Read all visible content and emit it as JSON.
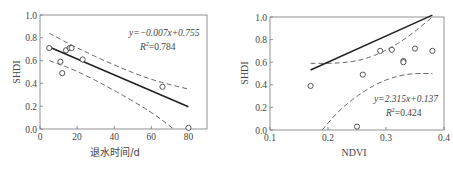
{
  "chart_data": [
    {
      "type": "scatter",
      "title": "",
      "xlabel": "退水时间/d",
      "ylabel": "SHDI",
      "xlim": [
        0,
        90
      ],
      "ylim": [
        0.0,
        1.0
      ],
      "xticks": [
        "0",
        "20",
        "40",
        "60",
        "80"
      ],
      "yticks": [
        "0.0",
        "0.2",
        "0.4",
        "0.6",
        "0.8",
        "1.0"
      ],
      "grid": false,
      "points": [
        {
          "x": 5,
          "y": 0.71
        },
        {
          "x": 11,
          "y": 0.59
        },
        {
          "x": 12,
          "y": 0.49
        },
        {
          "x": 14,
          "y": 0.69
        },
        {
          "x": 16,
          "y": 0.71
        },
        {
          "x": 17,
          "y": 0.71
        },
        {
          "x": 23,
          "y": 0.61
        },
        {
          "x": 66,
          "y": 0.37
        },
        {
          "x": 80,
          "y": 0.01
        }
      ],
      "fit": {
        "slope": -0.007,
        "intercept": 0.755,
        "x_range": [
          5,
          80
        ]
      },
      "confidence_band": {
        "upper": [
          [
            5,
            0.84
          ],
          [
            20,
            0.71
          ],
          [
            40,
            0.56
          ],
          [
            60,
            0.43
          ],
          [
            80,
            0.35
          ]
        ],
        "lower": [
          [
            5,
            0.6
          ],
          [
            20,
            0.51
          ],
          [
            40,
            0.34
          ],
          [
            60,
            0.15
          ],
          [
            72,
            0.0
          ]
        ]
      },
      "annotation": {
        "equation": "y=−0.007x+0.755",
        "r2": "R²=0.784"
      }
    },
    {
      "type": "scatter",
      "title": "",
      "xlabel": "NDVI",
      "ylabel": "SHDI",
      "xlim": [
        0.1,
        0.4
      ],
      "ylim": [
        0.0,
        1.0
      ],
      "xticks": [
        "0.1",
        "0.2",
        "0.3",
        "0.4"
      ],
      "yticks": [
        "0.0",
        "0.2",
        "0.4",
        "0.6",
        "0.8",
        "1.0"
      ],
      "grid": false,
      "points": [
        {
          "x": 0.17,
          "y": 0.39
        },
        {
          "x": 0.25,
          "y": 0.03
        },
        {
          "x": 0.26,
          "y": 0.49
        },
        {
          "x": 0.29,
          "y": 0.7
        },
        {
          "x": 0.31,
          "y": 0.71
        },
        {
          "x": 0.33,
          "y": 0.61
        },
        {
          "x": 0.33,
          "y": 0.6
        },
        {
          "x": 0.35,
          "y": 0.72
        },
        {
          "x": 0.38,
          "y": 0.7
        }
      ],
      "fit": {
        "slope": 2.315,
        "intercept": 0.137,
        "x_range": [
          0.17,
          0.38
        ]
      },
      "confidence_band": {
        "upper": [
          [
            0.17,
            0.59
          ],
          [
            0.22,
            0.59
          ],
          [
            0.26,
            0.62
          ],
          [
            0.3,
            0.7
          ],
          [
            0.34,
            0.83
          ],
          [
            0.38,
            1.0
          ]
        ],
        "lower": [
          [
            0.19,
            0.0
          ],
          [
            0.22,
            0.18
          ],
          [
            0.26,
            0.34
          ],
          [
            0.3,
            0.45
          ],
          [
            0.34,
            0.5
          ],
          [
            0.38,
            0.5
          ]
        ]
      },
      "annotation": {
        "equation": "y=2.315x+0.137",
        "r2": "R²=0.424"
      }
    }
  ],
  "left": {
    "xlabel": "退水时间/d",
    "ylabel": "SHDI",
    "eq": "y=−0.007x+0.755",
    "r2_prefix": "R",
    "r2_sup": "2",
    "r2_value": "=0.784",
    "xticks": [
      "0",
      "20",
      "40",
      "60",
      "80"
    ],
    "yticks": [
      "0.0",
      "0.2",
      "0.4",
      "0.6",
      "0.8",
      "1.0"
    ]
  },
  "right": {
    "xlabel": "NDVI",
    "ylabel": "SHDI",
    "eq": "y=2.315x+0.137",
    "r2_prefix": "R",
    "r2_sup": "2",
    "r2_value": "=0.424",
    "xticks": [
      "0.1",
      "0.2",
      "0.3",
      "0.4"
    ],
    "yticks": [
      "0.0",
      "0.2",
      "0.4",
      "0.6",
      "0.8",
      "1.0"
    ]
  }
}
